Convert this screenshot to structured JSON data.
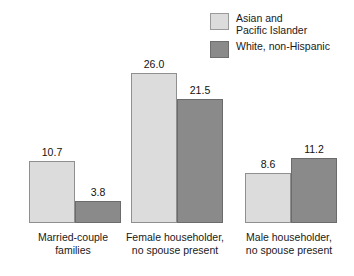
{
  "chart_data": {
    "type": "bar",
    "title": "",
    "xlabel": "",
    "ylabel": "",
    "grid": false,
    "legend_position": "top-right",
    "ylim": [
      0,
      26.0
    ],
    "categories": [
      "Married-couple\nfamilies",
      "Female householder,\nno spouse present",
      "Male householder,\nno spouse present"
    ],
    "series": [
      {
        "name": "Asian and\nPacific Islander",
        "color": "#dcdcdc",
        "border_color": "#8f8f8f",
        "values": [
          10.7,
          26.0,
          8.6
        ],
        "value_labels": [
          "10.7",
          "26.0",
          "8.6"
        ]
      },
      {
        "name": "White, non-Hispanic",
        "color": "#8a8a8a",
        "border_color": "#6b6b6b",
        "values": [
          3.8,
          21.5,
          11.2
        ],
        "value_labels": [
          "3.8",
          "21.5",
          "11.2"
        ]
      }
    ]
  },
  "legend": {
    "items": [
      {
        "label": "Asian and\nPacific Islander",
        "swatch": "light"
      },
      {
        "label": "White, non-Hispanic",
        "swatch": "dark"
      }
    ]
  }
}
